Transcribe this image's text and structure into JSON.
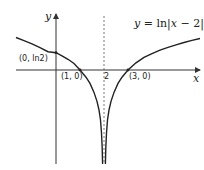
{
  "diagram": {
    "equation": {
      "y": "y",
      "eq": " = ln|",
      "x": "x",
      "rest": " − 2|"
    },
    "axes": {
      "x_label": "x",
      "y_label": "y"
    },
    "points": [
      {
        "label": "(0, ln2)",
        "x": 0,
        "y": 0.693
      },
      {
        "label": "(1, 0)",
        "x": 1,
        "y": 0
      },
      {
        "label": "(3, 0)",
        "x": 3,
        "y": 0
      }
    ],
    "asymptote": {
      "label": "2",
      "x": 2
    },
    "colors": {
      "curve": "#222222",
      "axis": "#333333",
      "asymptote": "#555555"
    }
  }
}
